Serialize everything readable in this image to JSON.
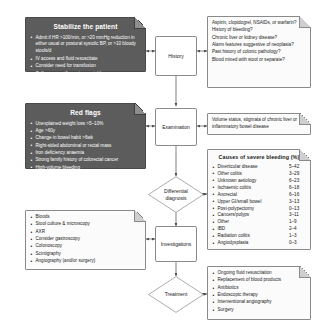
{
  "flow": {
    "nodes": [
      {
        "id": "history",
        "label": "History"
      },
      {
        "id": "examination",
        "label": "Examination"
      },
      {
        "id": "differential",
        "label": "Differential diagnosis"
      },
      {
        "id": "investigations",
        "label": "Investigations"
      },
      {
        "id": "treatment",
        "label": "Treatment"
      }
    ]
  },
  "stabilize": {
    "title": "Stabilize the patient",
    "items": [
      "Admit if HR >100/min, or >20 mmHg reduction in either usual or postural systolic BP, or >10 bloody stools/d",
      "IV access and fluid resuscitate",
      "Consider need for transfusion",
      "Call surgeons if remains unstable"
    ]
  },
  "red_flags": {
    "title": "Red flags",
    "items": [
      "Unexplained weight loss >5–10%",
      "Age >60y",
      "Change in bowel habit >6wk",
      "Right-sided abdominal or rectal mass",
      "Iron deficiency anaemia",
      "Strong family history of colorectal cancer",
      "High-volume bleeding",
      "Passage of altered blood"
    ]
  },
  "history_notes": {
    "items": [
      "Aspirin, clopidogrel, NSAIDs, or warfarin?",
      "History of bleeding?",
      "Chronic liver or kidney disease?",
      "Alarm features suggestive of neoplasia?",
      "Past history of colonic pathology?",
      "Blood mixed with stool or separate?"
    ]
  },
  "examination_notes": {
    "items": [
      "Volume status, stigmata of chronic liver or inflammatory bowel disease"
    ]
  },
  "causes": {
    "title": "Causes of severe bleeding (%)",
    "rows": [
      {
        "label": "Diverticular disease",
        "value": "5–42"
      },
      {
        "label": "Other colitis",
        "value": "3–29"
      },
      {
        "label": "Unknown aetiology",
        "value": "6–23"
      },
      {
        "label": "Ischaemic colitis",
        "value": "6–18"
      },
      {
        "label": "Anorectal",
        "value": "6–16"
      },
      {
        "label": "Upper GI/small bowel",
        "value": "3–13"
      },
      {
        "label": "Post-polypectomy",
        "value": "0–13"
      },
      {
        "label": "Cancers/polyps",
        "value": "3–11"
      },
      {
        "label": "Other",
        "value": "1–9"
      },
      {
        "label": "IBD",
        "value": "2–4"
      },
      {
        "label": "Radiation colitis",
        "value": "1–3"
      },
      {
        "label": "Angiodysplasia",
        "value": "0–3"
      }
    ]
  },
  "investigations_notes": {
    "items": [
      "Bloods",
      "Stool culture & microscopy",
      "AXR",
      "Consider gastroscopy",
      "Colonoscopy",
      "Scintigraphy",
      "Angiography (and/or surgery)"
    ]
  },
  "treatment_notes": {
    "items": [
      "Ongoing fluid resuscitation",
      "Replacement of blood products",
      "Antibiotics",
      "Endoscopic therapy",
      "Interventional angiography",
      "Surgery"
    ]
  },
  "colors": {
    "dark_box": "#5c5c5c",
    "light_box": "#fbfbfb",
    "border": "#8a8a8a",
    "background": "#ffffff"
  }
}
